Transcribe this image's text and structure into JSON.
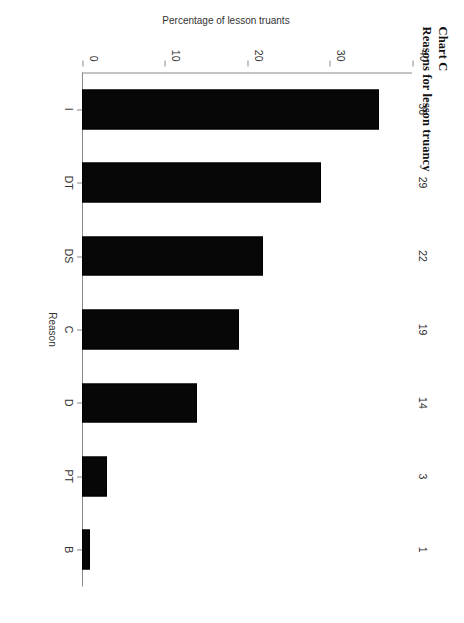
{
  "title": {
    "line1": "Chart C",
    "line2": "Reasons for lesson truancy"
  },
  "chart_data": {
    "type": "bar",
    "orientation": "vertical-rotated",
    "title": "Reasons for lesson truancy",
    "subtitle": "Chart C",
    "categories": [
      "I",
      "DT",
      "DS",
      "C",
      "D",
      "PT",
      "B"
    ],
    "values": [
      36,
      29,
      22,
      19,
      14,
      3,
      1
    ],
    "xlabel": "Reason",
    "ylabel": "Percentage of lesson truants",
    "ylim": [
      0,
      40
    ],
    "yticks": [
      0,
      10,
      20,
      30,
      40
    ],
    "ytick_labels": [
      "0",
      "10",
      "20",
      "30",
      "40"
    ],
    "grid": false,
    "legend": false,
    "data_labels": [
      "36",
      "29",
      "22",
      "19",
      "14",
      "3",
      "1"
    ],
    "bar_color": "#070707",
    "axis_color": "#8a8a8a"
  }
}
